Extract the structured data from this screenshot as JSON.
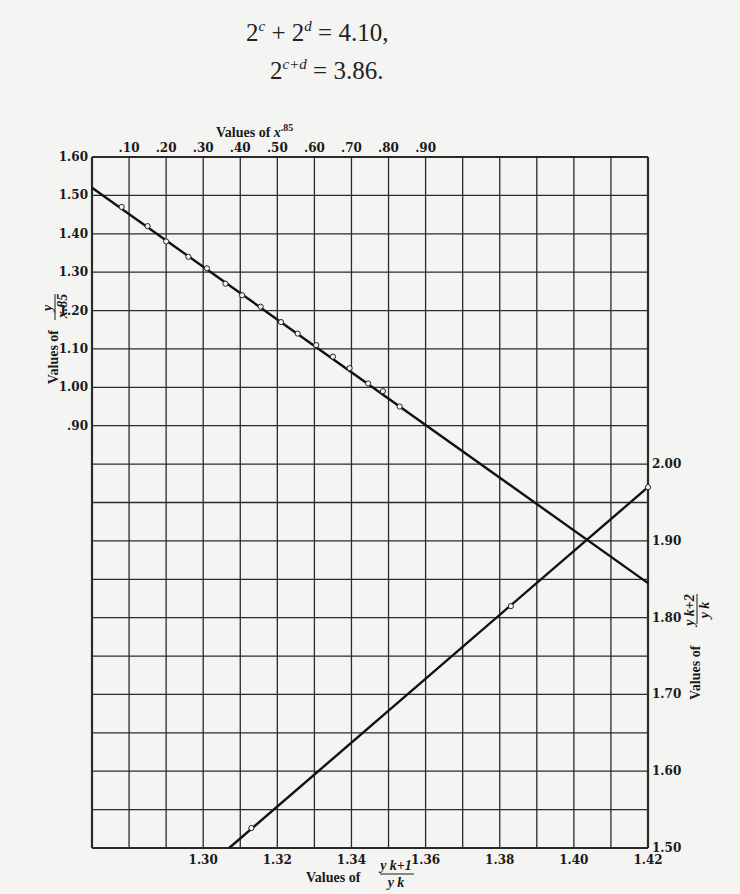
{
  "equations": {
    "eq1": {
      "lhs_a": "2",
      "exp_a": "c",
      "plus": "+",
      "lhs_b": "2",
      "exp_b": "d",
      "rhs": "= 4.10,"
    },
    "eq2": {
      "lhs": "2",
      "exp": "c+d",
      "rhs": "= 3.86."
    }
  },
  "chart_data": {
    "type": "line",
    "title": "",
    "grid": true,
    "axes": {
      "top": {
        "label": "Values of x^.85",
        "label_text": "Values of ",
        "label_var": "x",
        "label_exp": ".85",
        "ticks": [
          ".10",
          ".20",
          ".30",
          ".40",
          ".50",
          ".60",
          ".70",
          ".80",
          ".90"
        ],
        "range": [
          0,
          1.5
        ]
      },
      "left": {
        "label": "Values of y / x^.85",
        "label_text": "Values of",
        "frac_num": "y",
        "frac_den": "x.85",
        "ticks": [
          "1.60",
          "1.50",
          "1.40",
          "1.30",
          "1.20",
          "1.10",
          "1.00",
          ".90"
        ],
        "range": [
          -0.2,
          1.6
        ]
      },
      "bottom": {
        "label": "Values of y_{k+1} / y_k",
        "label_text": "Values of",
        "frac_num": "y k+1",
        "frac_den": "y k",
        "ticks": [
          "1.30",
          "1.32",
          "1.34",
          "1.36",
          "1.38",
          "1.40",
          "1.42"
        ],
        "range": [
          1.27,
          1.42
        ]
      },
      "right": {
        "label": "Values of y_{k+2} / y_k",
        "label_text": "Values of",
        "frac_num": "y k+2",
        "frac_den": "y k",
        "ticks": [
          "2.00",
          "1.90",
          "1.80",
          "1.70",
          "1.60",
          "1.50"
        ],
        "range": [
          1.5,
          2.0
        ]
      }
    },
    "series": [
      {
        "name": "y / x^.85 vs x^.85 (top/left axes)",
        "line": {
          "x": [
            0.0,
            1.5
          ],
          "y": [
            1.52,
            0.49
          ]
        },
        "points_x": [
          0.08,
          0.15,
          0.2,
          0.26,
          0.31,
          0.36,
          0.405,
          0.455,
          0.51,
          0.555,
          0.605,
          0.65,
          0.695,
          0.745,
          0.785,
          0.83
        ],
        "points_y": [
          1.47,
          1.42,
          1.38,
          1.34,
          1.31,
          1.27,
          1.24,
          1.21,
          1.17,
          1.14,
          1.11,
          1.08,
          1.05,
          1.01,
          0.99,
          0.95
        ]
      },
      {
        "name": "y_{k+2}/y_k vs y_{k+1}/y_k (bottom/right axes)",
        "line": {
          "x": [
            1.307,
            1.42
          ],
          "y": [
            1.5,
            1.97
          ]
        },
        "points_x": [
          1.313,
          1.383,
          1.42
        ],
        "points_y": [
          1.526,
          1.815,
          1.97
        ]
      }
    ]
  }
}
